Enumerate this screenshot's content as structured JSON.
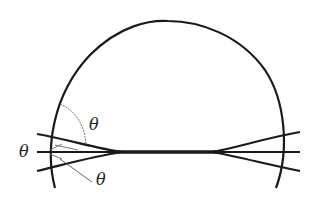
{
  "diagram": {
    "colors": {
      "stroke": "#1a1a1a",
      "thin_stroke": "#555555",
      "background": "#ffffff"
    },
    "labels": {
      "theta_top": "θ",
      "theta_left": "θ",
      "theta_bottom": "θ"
    }
  }
}
